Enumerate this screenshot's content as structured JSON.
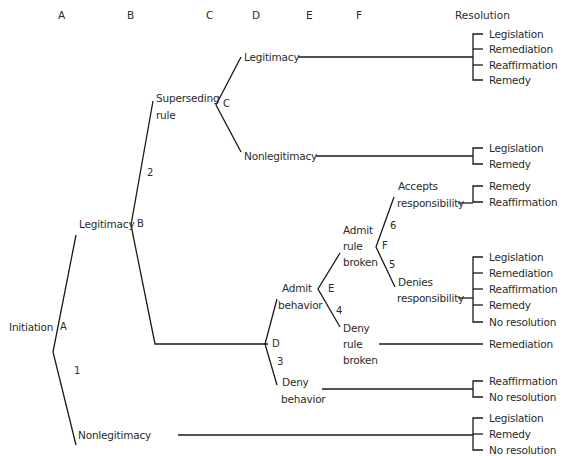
{
  "columns": {
    "A": "A",
    "B": "B",
    "C": "C",
    "D": "D",
    "E": "E",
    "F": "F",
    "resolution": "Resolution"
  },
  "nodes": {
    "initiation": "Initiation",
    "legitimacy_b": "Legitimacy",
    "nonlegitimacy_a": "Nonlegitimacy",
    "superseding_rule_1": "Superseding",
    "superseding_rule_2": "rule",
    "legitimacy_c": "Legitimacy",
    "nonlegitimacy_c": "Nonlegitimacy",
    "admit_behavior_1": "Admit",
    "admit_behavior_2": "behavior",
    "deny_behavior_1": "Deny",
    "deny_behavior_2": "behavior",
    "admit_rule_broken_1": "Admit",
    "admit_rule_broken_2": "rule",
    "admit_rule_broken_3": "broken",
    "deny_rule_broken_1": "Deny",
    "deny_rule_broken_2": "rule",
    "deny_rule_broken_3": "broken",
    "accepts_resp_1": "Accepts",
    "accepts_resp_2": "responsibility",
    "denies_resp_1": "Denies",
    "denies_resp_2": "responsibility"
  },
  "decision_points": {
    "A": "A",
    "B": "B",
    "C": "C",
    "D": "D",
    "E": "E",
    "F": "F"
  },
  "branch_numbers": {
    "n1": "1",
    "n2": "2",
    "n3": "3",
    "n4": "4",
    "n5": "5",
    "n6": "6"
  },
  "resolutions": {
    "legitimacy_c": [
      "Legislation",
      "Remediation",
      "Reaffirmation",
      "Remedy"
    ],
    "nonlegitimacy_c": [
      "Legislation",
      "Remedy"
    ],
    "accepts_responsibility": [
      "Remedy",
      "Reaffirmation"
    ],
    "denies_responsibility": [
      "Legislation",
      "Remediation",
      "Reaffirmation",
      "Remedy",
      "No resolution"
    ],
    "deny_rule_broken": [
      "Remediation"
    ],
    "deny_behavior": [
      "Reaffirmation",
      "No resolution"
    ],
    "nonlegitimacy_a": [
      "Legislation",
      "Remedy",
      "No resolution"
    ]
  }
}
